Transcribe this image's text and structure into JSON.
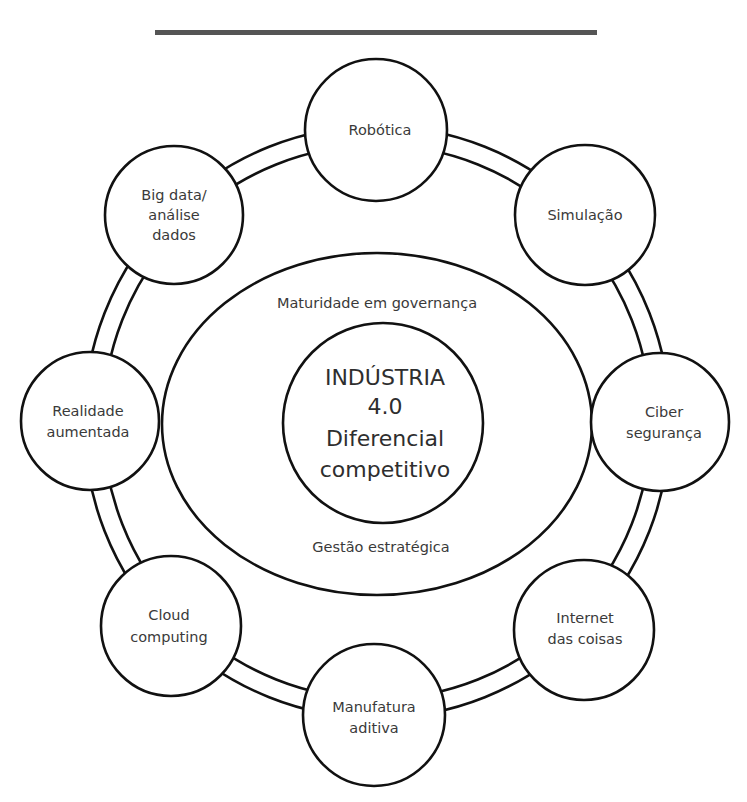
{
  "header_bar": {
    "color": "#555555"
  },
  "diagram": {
    "center": {
      "lines": [
        "INDÚSTRIA",
        "4.0",
        "Diferencial",
        "competitivo"
      ]
    },
    "ellipse": {
      "top_label": "Maturidade em governança",
      "bottom_label": "Gestão estratégica"
    },
    "ring_nodes": [
      {
        "id": "robotica",
        "lines": [
          "Robótica"
        ]
      },
      {
        "id": "simulacao",
        "lines": [
          "Simulação"
        ]
      },
      {
        "id": "ciber-seguranca",
        "lines": [
          "Ciber",
          "segurança"
        ]
      },
      {
        "id": "internet-das-coisas",
        "lines": [
          "Internet",
          "das coisas"
        ]
      },
      {
        "id": "manufatura-aditiva",
        "lines": [
          "Manufatura",
          "aditiva"
        ]
      },
      {
        "id": "cloud-computing",
        "lines": [
          "Cloud",
          "computing"
        ]
      },
      {
        "id": "realidade-aumentada",
        "lines": [
          "Realidade",
          "aumentada"
        ]
      },
      {
        "id": "big-data",
        "lines": [
          "Big data/",
          "análise",
          "dados"
        ]
      }
    ],
    "colors": {
      "stroke": "#111111",
      "text": "#3a3a3a",
      "background": "#ffffff"
    }
  }
}
